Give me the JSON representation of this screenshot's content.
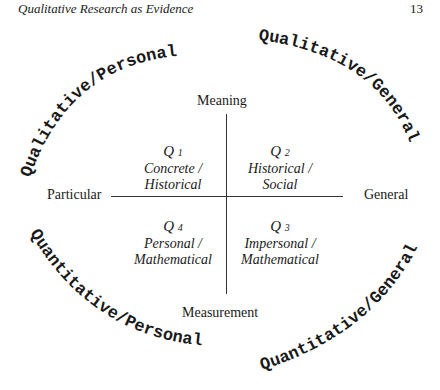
{
  "header": {
    "title": "Qualitative Research as Evidence",
    "page_number": "13"
  },
  "diagram": {
    "axes": {
      "top": "Meaning",
      "bottom": "Measurement",
      "left": "Particular",
      "right": "General"
    },
    "quadrants": [
      {
        "id": "Q1",
        "q": "Q",
        "num": "1",
        "line1": "Concrete /",
        "line2": "Historical"
      },
      {
        "id": "Q2",
        "q": "Q",
        "num": "2",
        "line1": "Historical /",
        "line2": "Social"
      },
      {
        "id": "Q3",
        "q": "Q",
        "num": "3",
        "line1": "Impersonal /",
        "line2": "Mathematical"
      },
      {
        "id": "Q4",
        "q": "Q",
        "num": "4",
        "line1": "Personal /",
        "line2": "Mathematical"
      }
    ],
    "arc_labels": {
      "top_left": "Qualitative/Personal",
      "top_right": "Qualitative/General",
      "bottom_left": "Quantitative/Personal",
      "bottom_right": "Quantitative/General"
    }
  }
}
